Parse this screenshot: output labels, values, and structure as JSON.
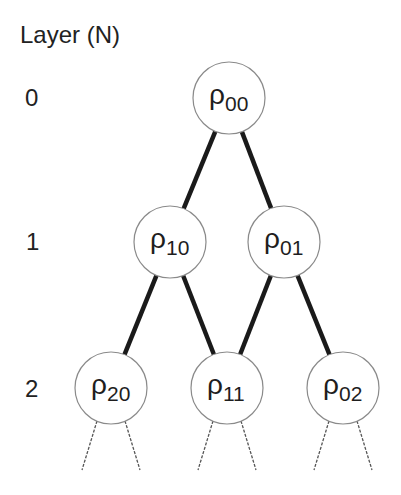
{
  "header": {
    "title": "Layer (N)"
  },
  "layers": [
    {
      "label": "0",
      "y": 98
    },
    {
      "label": "1",
      "y": 242
    },
    {
      "label": "2",
      "y": 388
    }
  ],
  "nodes": [
    {
      "id": "p00",
      "symbol": "ρ",
      "sub": "00",
      "cx": 229,
      "cy": 98
    },
    {
      "id": "p10",
      "symbol": "ρ",
      "sub": "10",
      "cx": 170,
      "cy": 242
    },
    {
      "id": "p01",
      "symbol": "ρ",
      "sub": "01",
      "cx": 284,
      "cy": 242
    },
    {
      "id": "p20",
      "symbol": "ρ",
      "sub": "20",
      "cx": 111,
      "cy": 388
    },
    {
      "id": "p11",
      "symbol": "ρ",
      "sub": "11",
      "cx": 227,
      "cy": 388
    },
    {
      "id": "p02",
      "symbol": "ρ",
      "sub": "02",
      "cx": 343,
      "cy": 388
    }
  ],
  "edges": [
    {
      "from": "p00",
      "to": "p10"
    },
    {
      "from": "p00",
      "to": "p01"
    },
    {
      "from": "p10",
      "to": "p20"
    },
    {
      "from": "p10",
      "to": "p11"
    },
    {
      "from": "p01",
      "to": "p11"
    },
    {
      "from": "p01",
      "to": "p02"
    }
  ],
  "style": {
    "edge_color": "#1a1a1a",
    "node_stroke": "#8a8a8a",
    "dashed_color": "#555555"
  }
}
